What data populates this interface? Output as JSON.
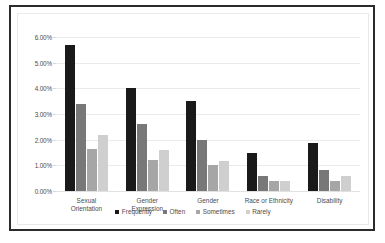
{
  "chart_data": {
    "type": "bar",
    "title": "",
    "subtitle": "",
    "xlabel": "",
    "ylabel": "",
    "categories": [
      "Sexual Orientation",
      "Gender Expression",
      "Gender",
      "Race or Ethnicity",
      "Disability"
    ],
    "category_lines": [
      [
        "Sexual",
        "Orientation"
      ],
      [
        "Gender",
        "Expression"
      ],
      [
        "Gender"
      ],
      [
        "Race or Ethnicity"
      ],
      [
        "Disability"
      ]
    ],
    "series": [
      {
        "name": "Frequently",
        "color": "#1a1a1a",
        "values": [
          5.7,
          4.0,
          3.5,
          1.48,
          1.88
        ]
      },
      {
        "name": "Often",
        "color": "#787878",
        "values": [
          3.4,
          2.6,
          2.0,
          0.58,
          0.8
        ]
      },
      {
        "name": "Sometimes",
        "color": "#a6a6a6",
        "values": [
          1.65,
          1.2,
          1.0,
          0.4,
          0.4
        ]
      },
      {
        "name": "Rarely",
        "color": "#cfcfcf",
        "values": [
          2.18,
          1.58,
          1.18,
          0.4,
          0.58
        ]
      }
    ],
    "ylim": [
      0,
      6
    ],
    "ytick_values": [
      0,
      1,
      2,
      3,
      4,
      5,
      6
    ],
    "ytick_labels": [
      "0.00%",
      "1.00%",
      "2.00%",
      "3.00%",
      "4.00%",
      "5.00%",
      "6.00%"
    ],
    "grid": true,
    "grid_axis": "y",
    "legend": [
      "Frequently",
      "Often",
      "Sometimes",
      "Rarely"
    ],
    "legend_position": "bottom",
    "legend_marker": "square",
    "value_suffix": "%"
  },
  "style": {
    "outer_border_color": "#2b2b2b",
    "plot_border_color": "#e9e9e9",
    "gridline_color": "#eceaea",
    "text_color": "#4c4c4c",
    "background": "#ffffff"
  }
}
